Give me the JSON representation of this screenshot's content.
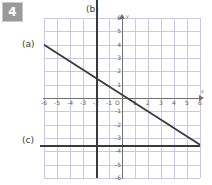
{
  "question": {
    "number": "4"
  },
  "callouts": [
    {
      "key": "a",
      "label": "(a)"
    },
    {
      "key": "b",
      "label": "(b)"
    },
    {
      "key": "c",
      "label": "(c)"
    }
  ],
  "axis_names": {
    "x": "x",
    "y": "y",
    "origin": "O"
  },
  "colors": {
    "grid": "#c9c9e4",
    "axis": "#6f6f6f",
    "line": "#3a3a3a",
    "badge_bg": "#9a9a9a",
    "badge_fg": "#ffffff",
    "background": "#ffffff"
  },
  "chart_data": {
    "type": "line",
    "title": "",
    "xlabel": "x",
    "ylabel": "y",
    "xlim": [
      -6,
      6
    ],
    "ylim": [
      -6,
      6
    ],
    "grid": true,
    "legend_position": "inline-callouts",
    "xticks": [
      -6,
      -5,
      -4,
      -3,
      -2,
      -1,
      1,
      2,
      3,
      4,
      5,
      6
    ],
    "yticks": [
      6,
      5,
      4,
      3,
      2,
      1,
      -1,
      -2,
      -3,
      -4,
      -5,
      -6
    ],
    "xtick_labels": [
      "-6",
      "-5",
      "-4",
      "-3",
      "-2",
      "-1",
      "1",
      "2",
      "3",
      "4",
      "5",
      "6"
    ],
    "ytick_labels": [
      "6",
      "5",
      "4",
      "3",
      "2",
      "1",
      "-1",
      "-2",
      "-3",
      "-4",
      "-5",
      "-6"
    ],
    "series": [
      {
        "name": "(a)",
        "kind": "oblique",
        "slope": -0.625,
        "intercept": 0.25,
        "points": [
          [
            -6,
            4
          ],
          [
            6,
            -3.5
          ]
        ],
        "label_at": [
          -6,
          4
        ]
      },
      {
        "name": "(b)",
        "kind": "vertical",
        "equation": "x = -2",
        "points": [
          [
            -2,
            6
          ],
          [
            -2,
            -6
          ]
        ],
        "label_at": [
          -2,
          6.6
        ]
      },
      {
        "name": "(c)",
        "kind": "horizontal",
        "equation": "y = -3.5",
        "points": [
          [
            -6,
            -3.5
          ],
          [
            6,
            -3.5
          ]
        ],
        "label_at": [
          -6,
          -3.5
        ]
      }
    ]
  }
}
